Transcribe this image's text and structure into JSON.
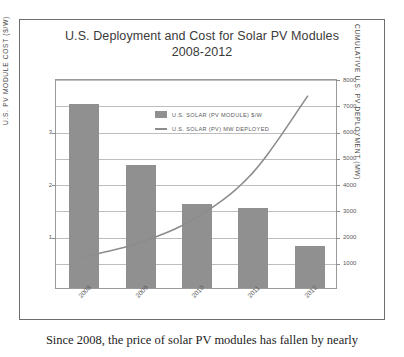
{
  "figure": {
    "title_line1": "U.S. Deployment and Cost for Solar PV Modules",
    "title_line2": "2008-2012"
  },
  "caption": "Since 2008, the price of solar PV modules has fallen by nearly",
  "colors": {
    "bar": "#909090",
    "line": "#8c8c8c",
    "grid": "#bdbdbd",
    "frame": "#6d6d6d",
    "text": "#4a4a4a"
  },
  "chart_data": {
    "type": "bar",
    "title": "U.S. Deployment and Cost for Solar PV Modules 2008-2012",
    "subtitle": "2008-2012",
    "xlabel": "",
    "categories": [
      "2008",
      "2009",
      "2010",
      "2011",
      "2012"
    ],
    "grid": true,
    "legend_position": "inside-top-center",
    "series": [
      {
        "name": "U.S. SOLAR (PV MODULE) $/W",
        "type": "bar",
        "axis": "left",
        "unit": "$/W",
        "values": [
          3.5,
          2.35,
          1.6,
          1.53,
          0.8
        ]
      },
      {
        "name": "U.S. SOLAR (PV) MW DEPLOYED",
        "type": "line",
        "axis": "right",
        "unit": "MW",
        "values": [
          1200,
          1750,
          2700,
          4400,
          7400
        ]
      }
    ],
    "left_axis": {
      "label": "U.S. PV MODULE COST ($/W)",
      "ticks": [
        1,
        2,
        3
      ],
      "tick_labels": [
        "1",
        "2",
        "3"
      ],
      "ylim": [
        0,
        4
      ]
    },
    "right_axis": {
      "label": "CUMULATIVE U.S. PV DEPLOYMENT (MW)",
      "ticks": [
        1000,
        2000,
        3000,
        4000,
        5000,
        6000,
        7000,
        8000
      ],
      "tick_labels": [
        "1000",
        "2000",
        "3000",
        "4000",
        "5000",
        "6000",
        "7000",
        "8000"
      ],
      "ylim": [
        0,
        8000
      ]
    }
  }
}
